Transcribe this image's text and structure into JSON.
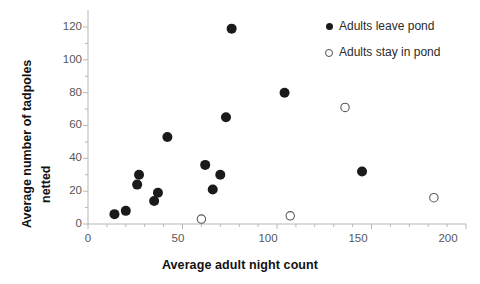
{
  "chart_data": {
    "type": "scatter",
    "title": "",
    "xlabel": "Average adult night count",
    "ylabel": "Average number of tadpoles netted",
    "ylabel_lines": [
      "Average number of tadpoles",
      "netted"
    ],
    "xlim": [
      0,
      200
    ],
    "ylim": [
      0,
      120
    ],
    "xticks": [
      0,
      50,
      100,
      150,
      200
    ],
    "yticks": [
      0,
      20,
      40,
      60,
      80,
      100,
      120
    ],
    "xtick_labels": [
      "0",
      "50",
      "100",
      "150",
      "200"
    ],
    "ytick_labels": [
      "0",
      "20",
      "40",
      "60",
      "80",
      "100",
      "120"
    ],
    "x_minor_tick_step": 10,
    "y_minor_tick_step": 10,
    "grid": false,
    "legend_position": "top-right",
    "series": [
      {
        "name": "Adults leave pond",
        "marker": "filled-circle",
        "color": "#1a1a1a",
        "points": [
          {
            "x": 14,
            "y": 6
          },
          {
            "x": 20,
            "y": 8
          },
          {
            "x": 26,
            "y": 24
          },
          {
            "x": 27,
            "y": 30
          },
          {
            "x": 35,
            "y": 14
          },
          {
            "x": 37,
            "y": 19
          },
          {
            "x": 42,
            "y": 53
          },
          {
            "x": 62,
            "y": 36
          },
          {
            "x": 66,
            "y": 21
          },
          {
            "x": 70,
            "y": 30
          },
          {
            "x": 73,
            "y": 65
          },
          {
            "x": 76,
            "y": 119
          },
          {
            "x": 104,
            "y": 80
          },
          {
            "x": 145,
            "y": 32
          }
        ]
      },
      {
        "name": "Adults stay in pond",
        "marker": "open-circle",
        "color": "#595959",
        "points": [
          {
            "x": 60,
            "y": 3
          },
          {
            "x": 107,
            "y": 5
          },
          {
            "x": 136,
            "y": 71
          },
          {
            "x": 183,
            "y": 16
          }
        ]
      }
    ]
  },
  "legend": {
    "items": [
      {
        "label": "Adults leave pond",
        "marker": "filled-circle"
      },
      {
        "label": "Adults stay in pond",
        "marker": "open-circle"
      }
    ]
  },
  "axes": {
    "x_title": "Average adult night count",
    "y_title_line_1": "Average number of tadpoles",
    "y_title_line_2": "netted"
  }
}
